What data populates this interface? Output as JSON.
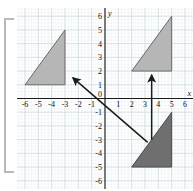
{
  "figure": {
    "type": "coordinate-grid-diagram",
    "background": "#ffffff",
    "crop_artifact_top_left": "",
    "crop_artifact_top_right": ""
  },
  "axes": {
    "x_label": "x",
    "y_label": "y",
    "x_ticks": [
      "-6",
      "-5",
      "-4",
      "-3",
      "-2",
      "-1",
      "0",
      "1",
      "2",
      "3",
      "4",
      "5",
      "6"
    ],
    "y_ticks": [
      "6",
      "5",
      "4",
      "3",
      "2",
      "1",
      "0",
      "-1",
      "-2",
      "-3",
      "-4",
      "-5",
      "-6"
    ],
    "xlim": [
      -6.6,
      6.6
    ],
    "ylim": [
      -6.6,
      6.6
    ],
    "grid": "minor and major gridlines shown",
    "grid_minor_color": "#e8eef2",
    "grid_major_color": "#cdd8de",
    "axis_color": "#1a1a1a"
  },
  "chart_data": {
    "type": "scatter",
    "title": "",
    "xlabel": "x",
    "ylabel": "y",
    "xlim": [
      -6.6,
      6.6
    ],
    "ylim": [
      -6.6,
      6.6
    ],
    "grid": true,
    "legend": "none",
    "shapes": [
      {
        "name": "P",
        "label": "P",
        "fill": "#6f6f6f",
        "stroke": "#4a4a4a",
        "label_color": "#111111",
        "label_xy": [
          4.0,
          -3.9
        ],
        "vertices": [
          [
            2,
            -5
          ],
          [
            5,
            -5
          ],
          [
            5,
            -1
          ]
        ]
      },
      {
        "name": "Q",
        "label": "Q",
        "fill": "#b6b6b6",
        "stroke": "#6a6a6a",
        "label_color": "#111111",
        "label_xy": [
          -4.6,
          2.2
        ],
        "vertices": [
          [
            -6,
            1
          ],
          [
            -3,
            1
          ],
          [
            -3,
            5
          ]
        ]
      },
      {
        "name": "R",
        "label": "R",
        "fill": "#b6b6b6",
        "stroke": "#6a6a6a",
        "label_color": "#111111",
        "label_xy": [
          3.6,
          3.1
        ],
        "vertices": [
          [
            2,
            2
          ],
          [
            5,
            2
          ],
          [
            5,
            6
          ]
        ]
      }
    ],
    "arrows": [
      {
        "name": "arrow-p-to-q",
        "from": [
          3.2,
          -3.2
        ],
        "to": [
          -2.4,
          1.5
        ],
        "color": "#1a1a1a"
      },
      {
        "name": "arrow-p-to-r",
        "from": [
          3.5,
          -3.0
        ],
        "to": [
          3.5,
          1.7
        ],
        "color": "#1a1a1a"
      }
    ]
  }
}
